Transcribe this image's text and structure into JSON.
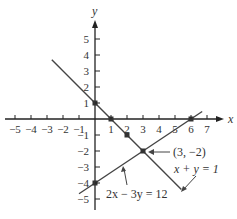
{
  "chart_data": {
    "type": "line",
    "title": "",
    "xlabel": "x",
    "ylabel": "y",
    "xlim": [
      -5.5,
      7.8
    ],
    "ylim": [
      -5.5,
      6.2
    ],
    "x_ticks": [
      -5,
      -4,
      -3,
      -2,
      -1,
      1,
      2,
      3,
      4,
      5,
      6,
      7
    ],
    "y_ticks": [
      -5,
      -4,
      -3,
      -2,
      -1,
      1,
      2,
      3,
      4,
      5
    ],
    "x_tick_labels": [
      "−5",
      "−4",
      "−3",
      "−2",
      "−1",
      "1",
      "2",
      "3",
      "4",
      "5",
      "6",
      "7"
    ],
    "y_tick_labels": [
      "−5",
      "−4",
      "−3",
      "−2",
      "−1",
      "1",
      "2",
      "3",
      "4",
      "5"
    ],
    "grid": false,
    "series": [
      {
        "name": "x + y = 1",
        "equation": "x + y = 1",
        "x": [
          -2.7,
          5.4
        ],
        "y": [
          3.7,
          -4.4
        ],
        "points": [
          [
            0,
            1
          ],
          [
            1,
            0
          ],
          [
            2,
            -1
          ],
          [
            3,
            -2
          ]
        ]
      },
      {
        "name": "2x − 3y = 12",
        "equation": "2x − 3y = 12",
        "x": [
          -1.0,
          6.7
        ],
        "y": [
          -4.67,
          0.47
        ],
        "points": [
          [
            0,
            -4
          ],
          [
            6,
            0
          ],
          [
            3,
            -2
          ]
        ]
      }
    ],
    "annotations": [
      {
        "text": "(3, −2)",
        "point": [
          3,
          -2
        ],
        "arrow": true
      },
      {
        "text": "x + y = 1",
        "arrow": true
      },
      {
        "text": "2x − 3y = 12",
        "arrow": true
      }
    ],
    "colors": {
      "line": "#444444",
      "axis": "#222222",
      "point": "#333333"
    }
  },
  "labels": {
    "x_axis": "x",
    "y_axis": "y",
    "intersection": "(3, −2)",
    "line1": "x + y = 1",
    "line2": "2x − 3y = 12"
  }
}
